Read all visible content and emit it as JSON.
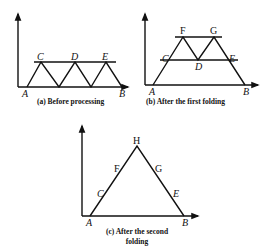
{
  "panels": [
    {
      "id": "a",
      "caption": "(a) Before processing",
      "labels": {
        "A": "A",
        "B": "B",
        "C": "C",
        "D": "D",
        "E": "E"
      }
    },
    {
      "id": "b",
      "caption": "(b) After the first folding",
      "labels": {
        "A": "A",
        "B": "B",
        "C": "C",
        "D": "D",
        "E": "E",
        "F": "F",
        "G": "G"
      }
    },
    {
      "id": "c",
      "caption_line1": "(c) After the second",
      "caption_line2": "folding",
      "labels": {
        "A": "A",
        "B": "B",
        "C": "C",
        "E": "E",
        "F": "F",
        "G": "G",
        "H": "H"
      }
    }
  ]
}
